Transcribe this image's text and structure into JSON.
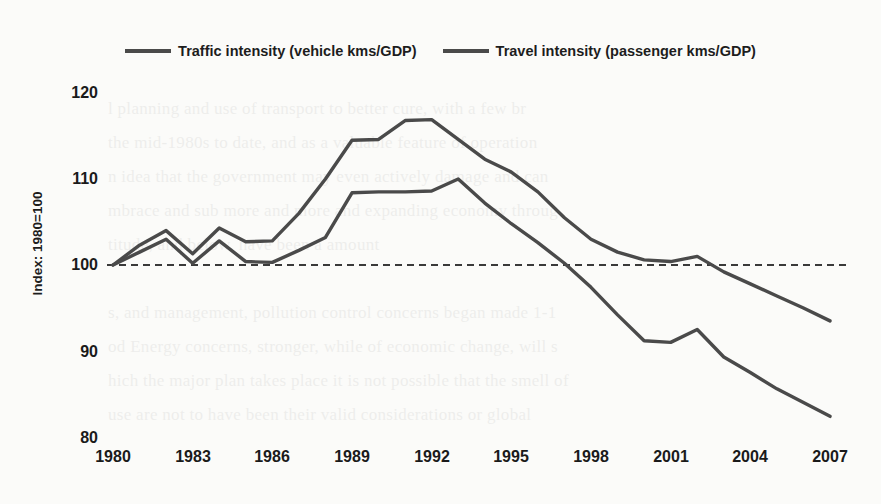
{
  "chart_data": {
    "type": "line",
    "title": "",
    "xlabel": "",
    "ylabel": "Index: 1980=100",
    "xlim": [
      1980,
      2007
    ],
    "ylim": [
      80,
      120
    ],
    "yticks": [
      80,
      90,
      100,
      110,
      120
    ],
    "xticks": [
      1980,
      1983,
      1986,
      1989,
      1992,
      1995,
      1998,
      2001,
      2004,
      2007
    ],
    "grid": false,
    "legend_position": "top-center",
    "reference_line": {
      "value": 100,
      "style": "dashed",
      "color": "#3a3a3a"
    },
    "x": [
      1980,
      1981,
      1982,
      1983,
      1984,
      1985,
      1986,
      1987,
      1988,
      1989,
      1990,
      1991,
      1992,
      1993,
      1994,
      1995,
      1996,
      1997,
      1998,
      1999,
      2000,
      2001,
      2002,
      2003,
      2004,
      2005,
      2006,
      2007
    ],
    "series": [
      {
        "name": "Traffic intensity (vehicle kms/GDP)",
        "color": "#4a4a4a",
        "values": [
          100.0,
          102.3,
          104.0,
          101.3,
          104.3,
          102.7,
          102.8,
          106.0,
          110.0,
          114.5,
          114.6,
          116.8,
          116.9,
          114.6,
          112.3,
          110.8,
          108.5,
          105.5,
          103.0,
          101.5,
          100.6,
          100.4,
          101.0,
          99.2,
          97.8,
          96.4,
          95.0,
          93.5
        ]
      },
      {
        "name": "Travel intensity (passenger kms/GDP)",
        "color": "#4a4a4a",
        "values": [
          100.0,
          101.5,
          103.0,
          100.2,
          102.8,
          100.4,
          100.3,
          101.7,
          103.2,
          108.4,
          108.5,
          108.5,
          108.6,
          110.0,
          107.2,
          104.8,
          102.6,
          100.2,
          97.4,
          94.2,
          91.2,
          91.0,
          92.5,
          89.3,
          87.5,
          85.6,
          84.0,
          82.4
        ]
      }
    ]
  },
  "legend": {
    "items": [
      {
        "label": "Traffic intensity (vehicle kms/GDP)"
      },
      {
        "label": "Travel intensity (passenger kms/GDP)"
      }
    ]
  },
  "axes": {
    "y_axis_label": "Index: 1980=100",
    "y_tick_labels": [
      "120",
      "110",
      "100",
      "90",
      "80"
    ],
    "x_tick_labels": [
      "1980",
      "1983",
      "1986",
      "1989",
      "1992",
      "1995",
      "1998",
      "2001",
      "2004",
      "2007"
    ]
  },
  "background_text": "l planning and use of transport to better cure, with a few br\nthe mid-1980s to date, and as a valuable feature of operation\nn idea that the government may even actively damage and can\nmbrace and sub more and more and expanding economy throug\ntitude, and below, have been a amount\n\ns, and management, pollution control concerns began made 1-1\nod Energy concerns, stronger, while of economic change, will s\nhich the major plan takes place it is not possible that the smell of\nuse are not to have been their valid considerations or global\nwral integration but by cargo, into traditional binomial system bu"
}
